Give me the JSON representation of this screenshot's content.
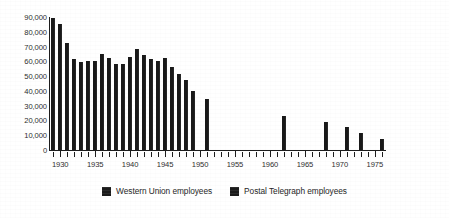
{
  "chart_data": {
    "type": "bar",
    "title": "",
    "subtitle": "",
    "xlabel": "",
    "ylabel": "",
    "xlim": [
      1928.4,
      1976.6
    ],
    "ylim": [
      0,
      90000
    ],
    "ytick_values": [
      0,
      10000,
      20000,
      30000,
      40000,
      50000,
      60000,
      70000,
      80000,
      90000
    ],
    "ytick_labels": [
      "0",
      "10,000",
      "20,000",
      "30,000",
      "40,000",
      "50,000",
      "60,000",
      "70,000",
      "80,000",
      "90,000"
    ],
    "xtick_labels": [
      "1930",
      "1935",
      "1940",
      "1945",
      "1950",
      "1955",
      "1960",
      "1965",
      "1970",
      "1975"
    ],
    "xtick_values": [
      1930,
      1935,
      1940,
      1945,
      1950,
      1955,
      1960,
      1965,
      1970,
      1975
    ],
    "xtick_minor_step": 1,
    "grid": false,
    "legend_position": "bottom-center",
    "bar_color": "#191919",
    "series": [
      {
        "name": "Western Union employees",
        "color": "#191919",
        "x": [
          1929,
          1930,
          1931,
          1932,
          1933,
          1934,
          1935,
          1936,
          1937,
          1938,
          1939,
          1940,
          1941,
          1942,
          1943,
          1944,
          1945,
          1946,
          1947,
          1948,
          1949,
          1951,
          1962,
          1968,
          1971,
          1973,
          1976
        ],
        "values": [
          89000,
          85000,
          72000,
          61000,
          59000,
          60000,
          60000,
          65000,
          62000,
          58000,
          58000,
          63000,
          68000,
          64000,
          61000,
          60000,
          62000,
          56000,
          51000,
          47000,
          40000,
          34000,
          23000,
          19000,
          15000,
          11000,
          7000
        ]
      },
      {
        "name": "Postal Telegraph employees",
        "color": "#191919",
        "x": [],
        "values": []
      }
    ]
  },
  "legend": {
    "entries": [
      {
        "label": "Western Union employees",
        "swatch_name": "legend-swatch-western-union"
      },
      {
        "label": "Postal Telegraph employees",
        "swatch_name": "legend-swatch-postal-telegraph"
      }
    ]
  }
}
